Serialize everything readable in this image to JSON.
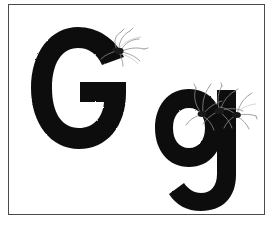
{
  "card": {
    "kind": "alphabet-flashcard",
    "background_color": "#ffffff",
    "border_color": "#4a4a4a",
    "ink_color": "#111111",
    "subject_label": "G g",
    "alt_text": "Letter G and letter g in heavy black type with several long-legged gnats perched on them"
  },
  "letters": {
    "uppercase": {
      "character": "G",
      "case_label": "uppercase",
      "ink_color": "#111111"
    },
    "lowercase": {
      "character": "g",
      "case_label": "lowercase",
      "ink_color": "#111111"
    }
  },
  "insects": {
    "common_name": "gnat",
    "leg_color": "#7d7d7d",
    "body_color": "#1a1a1a",
    "cluster_on_uppercase": {
      "location": "upper-right terminal of G",
      "count": 1
    },
    "cluster_on_lowercase": {
      "location": "shoulder of g",
      "count": 3
    }
  }
}
